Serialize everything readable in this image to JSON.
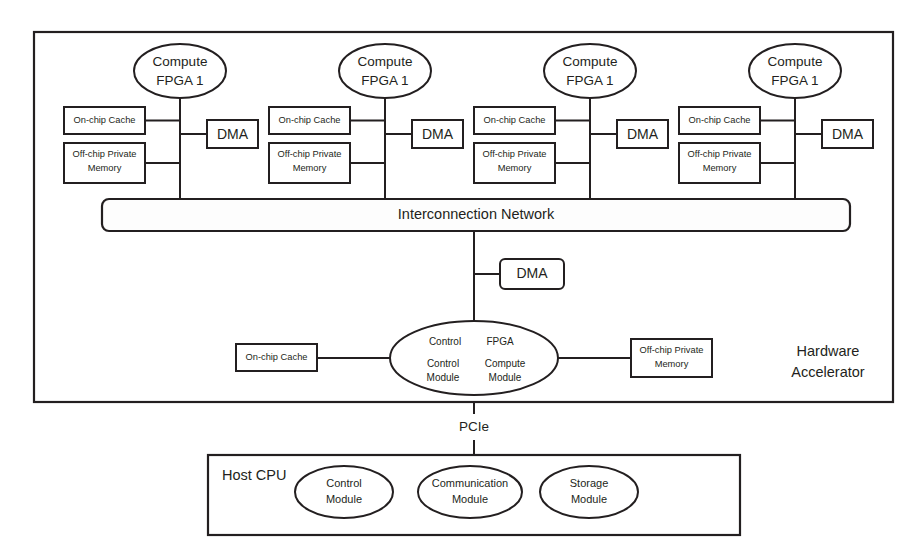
{
  "diagram": {
    "accelerator_label_line1": "Hardware",
    "accelerator_label_line2": "Accelerator",
    "interconnect_label": "Interconnection Network",
    "pcie_label": "PCIe",
    "host_label": "Host CPU",
    "colors": {
      "stroke": "#231f20",
      "fill": "#ffffff",
      "bar_fill": "#fdfdfd"
    }
  },
  "compute_nodes": [
    {
      "title_line1": "Compute",
      "title_line2": "FPGA 1",
      "cache_label": "On-chip Cache",
      "memory_line1": "Off-chip Private",
      "memory_line2": "Memory",
      "dma_label": "DMA"
    },
    {
      "title_line1": "Compute",
      "title_line2": "FPGA 1",
      "cache_label": "On-chip Cache",
      "memory_line1": "Off-chip Private",
      "memory_line2": "Memory",
      "dma_label": "DMA"
    },
    {
      "title_line1": "Compute",
      "title_line2": "FPGA 1",
      "cache_label": "On-chip Cache",
      "memory_line1": "Off-chip Private",
      "memory_line2": "Memory",
      "dma_label": "DMA"
    },
    {
      "title_line1": "Compute",
      "title_line2": "FPGA 1",
      "cache_label": "On-chip Cache",
      "memory_line1": "Off-chip Private",
      "memory_line2": "Memory",
      "dma_label": "DMA"
    }
  ],
  "center": {
    "dma_label": "DMA",
    "ellipse": {
      "top_left": "Control",
      "top_right": "FPGA",
      "bottom_left_line1": "Control",
      "bottom_left_line2": "Module",
      "bottom_right_line1": "Compute",
      "bottom_right_line2": "Module"
    },
    "cache_label": "On-chip Cache",
    "memory_line1": "Off-chip Private",
    "memory_line2": "Memory"
  },
  "host_modules": [
    {
      "line1": "Control",
      "line2": "Module"
    },
    {
      "line1": "Communication",
      "line2": "Module"
    },
    {
      "line1": "Storage",
      "line2": "Module"
    }
  ]
}
